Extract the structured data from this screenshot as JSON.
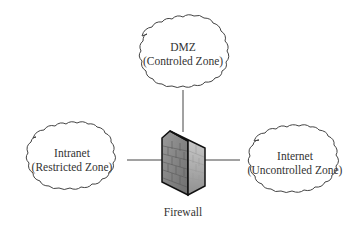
{
  "diagram": {
    "type": "network-zones",
    "center": {
      "id": "firewall",
      "label": "Firewall"
    },
    "zones": [
      {
        "id": "dmz",
        "title": "DMZ",
        "subtitle": "(Controled Zone)",
        "position": "top"
      },
      {
        "id": "intranet",
        "title": "Intranet",
        "subtitle": "(Restricted Zone)",
        "position": "left"
      },
      {
        "id": "internet",
        "title": "Internet",
        "subtitle": "(Uncontrolled Zone)",
        "position": "right"
      }
    ],
    "edges": [
      {
        "from": "firewall",
        "to": "dmz"
      },
      {
        "from": "firewall",
        "to": "intranet"
      },
      {
        "from": "firewall",
        "to": "internet"
      }
    ],
    "colors": {
      "stroke": "#333333",
      "firewall_front": "#8a8a8a",
      "firewall_side": "#b5b5b5",
      "background": "#ffffff"
    }
  }
}
